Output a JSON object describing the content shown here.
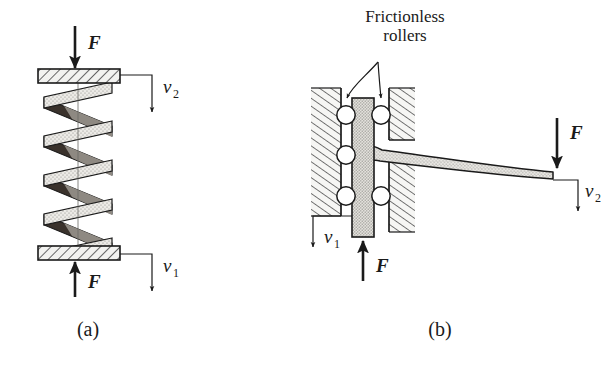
{
  "figure": {
    "background_color": "#ffffff",
    "ink_color": "#1a1a1a",
    "panels": [
      {
        "id": "panel-a",
        "caption": "(a)",
        "subject": "helical compression spring between two hatched plates",
        "labels": {
          "force_top": "F",
          "force_bottom": "F",
          "velocity_top": "v",
          "velocity_top_sub": "2",
          "velocity_bottom": "v",
          "velocity_bottom_sub": "1"
        }
      },
      {
        "id": "panel-b",
        "caption": "(b)",
        "subject": "cantilever beam on frictionless roller guided slider",
        "annotation_line1": "Frictionless",
        "annotation_line2": "rollers",
        "labels": {
          "force_tip": "F",
          "force_slider": "F",
          "velocity_tip": "v",
          "velocity_tip_sub": "2",
          "velocity_slider": "v",
          "velocity_slider_sub": "1"
        }
      }
    ],
    "colors": {
      "ink": "#1a1a1a",
      "hatch_plate_fill": "#f2f2f0",
      "spring_front_fill": "#e8e8e6",
      "spring_back_fill": "#3a322c",
      "spring_mid_fill": "#8e8982",
      "wall_fill": "#f4f4f2",
      "slider_fill": "#dededa",
      "beam_fill": "#d8d8d4",
      "roller_fill": "#ffffff"
    },
    "geometry": {
      "spring_turns": 4,
      "rollers_left_count": 3,
      "rollers_right_count": 3
    }
  }
}
